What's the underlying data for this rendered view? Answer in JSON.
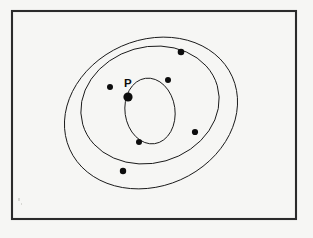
{
  "figure": {
    "background_color": "#f6f6f4",
    "page_color": "#fbfbf9",
    "stroke_color": "#1a1a1a",
    "border_color": "#2b2b2b",
    "dot_color": "#0d0d0d",
    "frame": {
      "x": 11,
      "y": 10,
      "width": 286,
      "height": 210
    },
    "labels": [
      {
        "id": "label-p",
        "text": "P",
        "x": 124,
        "y": 87
      }
    ],
    "circles": [
      {
        "id": "circle-large",
        "name": "outer-circle",
        "cx": 151,
        "cy": 113,
        "r": 73.5,
        "rotation": -22
      },
      {
        "id": "circle-medium",
        "name": "middle-circle",
        "cx": 150,
        "cy": 104,
        "r": 59.0,
        "rotation": -14
      },
      {
        "id": "circle-small",
        "name": "inner-circle",
        "cx": 150,
        "cy": 110,
        "r": 32.5,
        "rotation": 0
      }
    ],
    "ellipses": [
      {
        "id": "ellipse-large",
        "cx": 151,
        "cy": 113,
        "rx": 89,
        "ry": 73,
        "rotation": -24
      },
      {
        "id": "ellipse-medium",
        "cx": 150,
        "cy": 105,
        "rx": 70,
        "ry": 58,
        "rotation": -16
      },
      {
        "id": "ellipse-small",
        "cx": 150,
        "cy": 111,
        "rx": 25,
        "ry": 33,
        "rotation": -8
      }
    ],
    "points": [
      {
        "id": "point-p",
        "label": "P",
        "x": 128,
        "y": 97,
        "radius": 4.6,
        "kind": "common-point"
      },
      {
        "id": "point-upper-left",
        "label": "",
        "x": 110,
        "y": 87,
        "radius": 3.0,
        "kind": "intersection"
      },
      {
        "id": "point-upper-mid",
        "label": "",
        "x": 168,
        "y": 80,
        "radius": 3.0,
        "kind": "intersection"
      },
      {
        "id": "point-top-right",
        "label": "",
        "x": 181,
        "y": 52,
        "radius": 3.3,
        "kind": "intersection"
      },
      {
        "id": "point-right",
        "label": "",
        "x": 195,
        "y": 132,
        "radius": 3.1,
        "kind": "intersection"
      },
      {
        "id": "point-lower-inner",
        "label": "",
        "x": 139,
        "y": 142,
        "radius": 3.0,
        "kind": "intersection"
      },
      {
        "id": "point-bottom-left",
        "label": "",
        "x": 123,
        "y": 171,
        "radius": 3.2,
        "kind": "intersection"
      }
    ],
    "specks": [
      {
        "x": 18,
        "y": 198,
        "w": 2,
        "h": 3
      },
      {
        "x": 21,
        "y": 203,
        "w": 1,
        "h": 2
      }
    ]
  }
}
